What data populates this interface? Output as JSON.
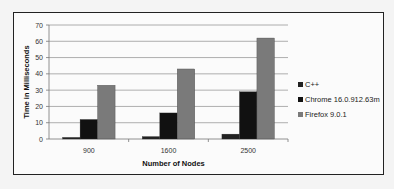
{
  "chart_data": {
    "type": "bar",
    "title": "",
    "xlabel": "Number of Nodes",
    "ylabel": "Time in Milliseconds",
    "categories": [
      "900",
      "1600",
      "2500"
    ],
    "series": [
      {
        "name": "C++",
        "color": "#222222",
        "values": [
          1,
          1.5,
          3
        ]
      },
      {
        "name": "Chrome 16.0.912.63m",
        "color": "#111111",
        "values": [
          12,
          16,
          29
        ]
      },
      {
        "name": "Firefox 9.0.1",
        "color": "#7a7a7a",
        "values": [
          33,
          43,
          62
        ]
      }
    ],
    "ylim": [
      0,
      70
    ],
    "yticks": [
      0,
      10,
      20,
      30,
      40,
      50,
      60,
      70
    ],
    "grid": true,
    "legend_position": "right"
  }
}
